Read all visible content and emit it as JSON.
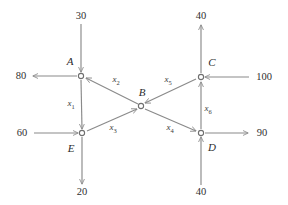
{
  "diagram": {
    "line_color": "#8a8a8a",
    "node_stroke_color": "#6f6f6f",
    "text_color": "#2b2b2b",
    "background": "#ffffff",
    "nodes": [
      {
        "id": "A",
        "label": "A",
        "x": 81,
        "y": 76,
        "label_x": 70,
        "label_y": 61
      },
      {
        "id": "B",
        "label": "B",
        "x": 141,
        "y": 106,
        "label_x": 142,
        "label_y": 92
      },
      {
        "id": "C",
        "label": "C",
        "x": 201,
        "y": 77,
        "label_x": 212,
        "label_y": 62
      },
      {
        "id": "D",
        "label": "D",
        "x": 201,
        "y": 133,
        "label_x": 212,
        "label_y": 147
      },
      {
        "id": "E",
        "label": "E",
        "x": 82,
        "y": 133,
        "label_x": 71,
        "label_y": 148
      }
    ],
    "internal_edges": [
      {
        "id": "x1",
        "label": "x",
        "sub": "1",
        "from": "A",
        "to": "E",
        "label_x": 71,
        "label_y": 105
      },
      {
        "id": "x2",
        "label": "x",
        "sub": "2",
        "from": "B",
        "to": "A",
        "label_x": 116,
        "label_y": 81
      },
      {
        "id": "x3",
        "label": "x",
        "sub": "3",
        "from": "E",
        "to": "B",
        "label_x": 113,
        "label_y": 129
      },
      {
        "id": "x4",
        "label": "x",
        "sub": "4",
        "from": "B",
        "to": "D",
        "label_x": 170,
        "label_y": 129
      },
      {
        "id": "x5",
        "label": "x",
        "sub": "5",
        "from": "C",
        "to": "B",
        "label_x": 168,
        "label_y": 81
      },
      {
        "id": "x6",
        "label": "x",
        "sub": "6",
        "from": "D",
        "to": "C",
        "label_x": 208,
        "label_y": 110
      }
    ],
    "external_flows": [
      {
        "id": "in-top-A",
        "value": "30",
        "node": "A",
        "direction": "in",
        "side": "top",
        "label_x": 81,
        "label_y": 16
      },
      {
        "id": "out-left-A",
        "value": "80",
        "node": "A",
        "direction": "out",
        "side": "left",
        "label_x": 21,
        "label_y": 76
      },
      {
        "id": "in-left-E",
        "value": "60",
        "node": "E",
        "direction": "in",
        "side": "left",
        "label_x": 22,
        "label_y": 133
      },
      {
        "id": "out-bot-E",
        "value": "20",
        "node": "E",
        "direction": "out",
        "side": "bottom",
        "label_x": 82,
        "label_y": 192
      },
      {
        "id": "out-top-C",
        "value": "40",
        "node": "C",
        "direction": "out",
        "side": "top",
        "label_x": 201,
        "label_y": 16
      },
      {
        "id": "in-right-C",
        "value": "100",
        "node": "C",
        "direction": "in",
        "side": "right",
        "label_x": 264,
        "label_y": 77
      },
      {
        "id": "out-right-D",
        "value": "90",
        "node": "D",
        "direction": "out",
        "side": "right",
        "label_x": 262,
        "label_y": 133
      },
      {
        "id": "in-bot-D",
        "value": "40",
        "node": "D",
        "direction": "in",
        "side": "bottom",
        "label_x": 201,
        "label_y": 192
      }
    ]
  }
}
